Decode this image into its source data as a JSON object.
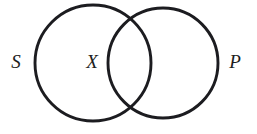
{
  "figure": {
    "type": "venn-diagram",
    "background_color": "#ffffff",
    "stroke_color": "#1c1c20",
    "stroke_width": 2.9,
    "width": 257,
    "height": 134
  },
  "circles": [
    {
      "id": "subject-circle",
      "label": "S",
      "cx": 93,
      "cy": 63,
      "r": 58
    },
    {
      "id": "predicate-circle",
      "label": "P",
      "cx": 163,
      "cy": 63,
      "r": 55
    }
  ],
  "labels": {
    "left_circle": {
      "text": "S",
      "x": 16,
      "y": 68
    },
    "inside_left_region": {
      "text": "X",
      "x": 92,
      "y": 68
    },
    "right_circle": {
      "text": "P",
      "x": 235,
      "y": 68
    }
  }
}
